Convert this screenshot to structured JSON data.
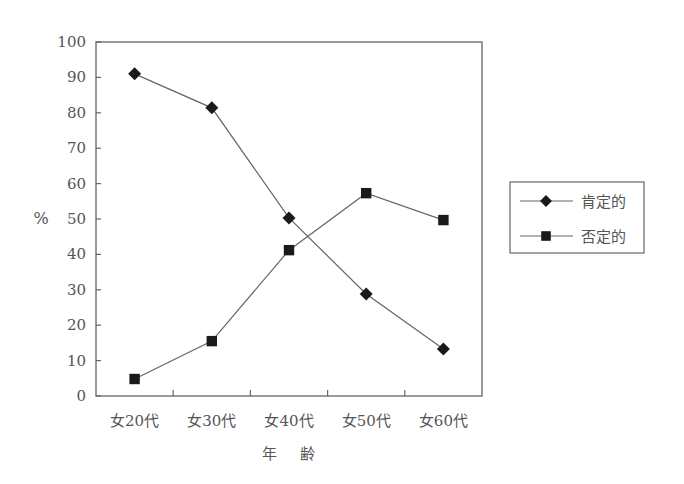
{
  "chart_data": {
    "type": "line",
    "title": "",
    "xlabel": "年　齢",
    "ylabel": "%",
    "ylim": [
      0,
      100
    ],
    "yticks": [
      0,
      10,
      20,
      30,
      40,
      50,
      60,
      70,
      80,
      90,
      100
    ],
    "grid": false,
    "legend_position": "right",
    "categories": [
      "女20代",
      "女30代",
      "女40代",
      "女50代",
      "女60代"
    ],
    "series": [
      {
        "name": "肯定的",
        "marker": "diamond",
        "values": [
          91,
          81.4,
          50.3,
          28.8,
          13.3
        ]
      },
      {
        "name": "否定的",
        "marker": "square",
        "values": [
          4.8,
          15.5,
          41.2,
          57.3,
          49.7
        ]
      }
    ]
  },
  "colors": {
    "axis": "#666666",
    "line": "#666666",
    "marker": "#1a1a1a",
    "text": "#555555"
  }
}
